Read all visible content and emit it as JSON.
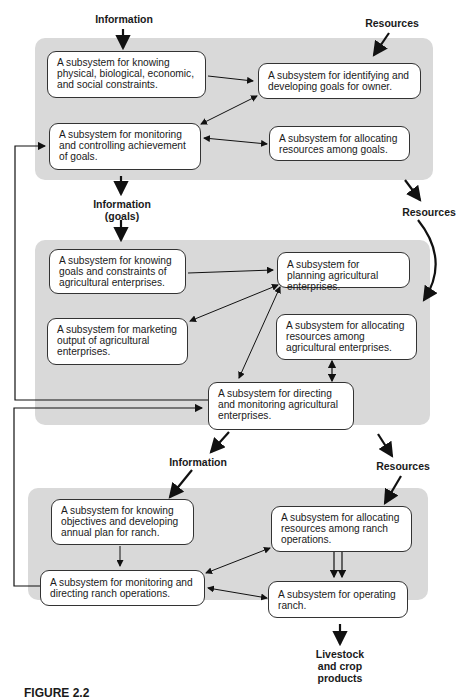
{
  "diagram": {
    "labels": {
      "top_information": "Information",
      "top_resources": "Resources",
      "mid_information_line1": "Information",
      "mid_information_line2": "(goals)",
      "mid_resources": "Resources",
      "low_information": "Information",
      "low_resources": "Resources",
      "output_line1": "Livestock",
      "output_line2": "and crop",
      "output_line3": "products"
    },
    "panel_owner": {
      "knowing_constraints": "A subsystem for knowing physical, biological, economic, and social constraints.",
      "identifying_goals": "A subsystem for identifying and developing goals for owner.",
      "monitoring_goals": "A subsystem for monitoring and controlling achievement of goals.",
      "allocating_goals": "A subsystem for allocating resources among goals."
    },
    "panel_enterprise": {
      "knowing_goals": "A subsystem for knowing goals and constraints of agricultural enterprises.",
      "planning": "A subsystem for planning agricultural enterprises.",
      "marketing": "A subsystem for marketing output of agricultural enterprises.",
      "allocating": "A subsystem for allocating resources among agricultural enterprises.",
      "directing": "A subsystem for directing and monitoring agricultural enterprises."
    },
    "panel_ranch": {
      "knowing_objectives": "A subsystem for knowing objectives and developing annual plan for ranch.",
      "allocating": "A subsystem for allocating resources among ranch operations.",
      "monitoring": "A subsystem for monitoring and directing ranch operations.",
      "operating": "A subsystem for operating ranch."
    },
    "caption": "FIGURE 2.2"
  }
}
